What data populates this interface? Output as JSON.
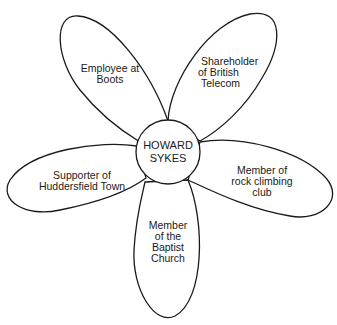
{
  "diagram": {
    "type": "identity-flower",
    "center": {
      "lines": [
        "HOWARD",
        "SYKES"
      ]
    },
    "petals": [
      {
        "position": "top-left",
        "lines": [
          "Employee at",
          "Boots"
        ]
      },
      {
        "position": "top-right",
        "lines": [
          "Shareholder",
          "of British",
          "Telecom"
        ]
      },
      {
        "position": "right",
        "lines": [
          "Member of",
          "rock climbing",
          "club"
        ]
      },
      {
        "position": "bottom",
        "lines": [
          "Member",
          "of the",
          "Baptist",
          "Church"
        ]
      },
      {
        "position": "left",
        "lines": [
          "Supporter of",
          "Huddersfield Town"
        ]
      }
    ],
    "colors": {
      "stroke": "#1a1a1a",
      "fill": "#ffffff",
      "text": "#1a1a1a"
    }
  }
}
